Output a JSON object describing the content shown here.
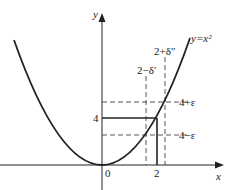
{
  "diagram": {
    "curve_label": "y=x²",
    "axes": {
      "x_label": "x",
      "y_label": "y"
    },
    "ticks": {
      "origin": "0",
      "x_two": "2",
      "y_four": "4"
    },
    "dashed_labels": {
      "upper_eps": "4+ε",
      "lower_eps": "4−ε",
      "delta_left": "2−δ′",
      "delta_right": "2+δ″"
    },
    "colors": {
      "line": "#222222",
      "dash": "#444444",
      "background": "#ffffff"
    }
  }
}
